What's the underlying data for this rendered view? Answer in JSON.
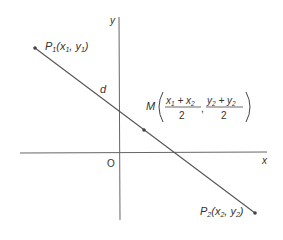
{
  "diagram": {
    "type": "coordinate-geometry",
    "axes": {
      "x_label": "x",
      "y_label": "y",
      "origin_label": "O"
    },
    "segment_label": "d",
    "points": {
      "p1": {
        "name": "P",
        "sub": "1",
        "coords": "(x",
        "c1sub": "1",
        "sep": ", y",
        "c2sub": "1",
        "close": ")"
      },
      "p2": {
        "name": "P",
        "sub": "2",
        "coords": "(x",
        "c1sub": "2",
        "sep": ", y",
        "c2sub": "2",
        "close": ")"
      },
      "midpoint": {
        "name": "M",
        "num1": "x",
        "num1_sub_a": "1",
        "plus": " + x",
        "num1_sub_b": "2",
        "den1": "2",
        "comma": ",",
        "num2": "y",
        "num2_sub_a": "2",
        "plus2": " + y",
        "num2_sub_b": "2",
        "den2": "2"
      }
    },
    "colors": {
      "line": "#555555",
      "axis": "#555555",
      "text": "#333333"
    }
  }
}
